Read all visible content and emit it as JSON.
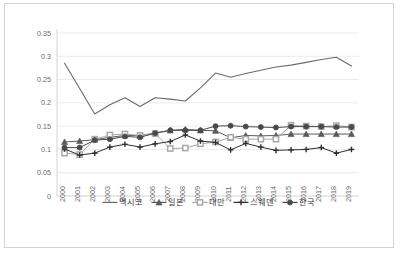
{
  "chart_data": {
    "type": "line",
    "title": "",
    "xlabel": "",
    "ylabel": "",
    "ylim": [
      0,
      0.35
    ],
    "grid": true,
    "legend_position": "bottom",
    "yticks": [
      "0",
      "0.05",
      "0.1",
      "0.15",
      "0.2",
      "0.25",
      "0.3",
      "0.35"
    ],
    "ytick_values": [
      0,
      0.05,
      0.1,
      0.15,
      0.2,
      0.25,
      0.3,
      0.35
    ],
    "categories": [
      "2000",
      "2001",
      "2002",
      "2003",
      "2004",
      "2005",
      "2006",
      "2007",
      "2008",
      "2009",
      "2010",
      "2011",
      "2012",
      "2013",
      "2014",
      "2015",
      "2016",
      "2017",
      "2018",
      "2019"
    ],
    "series": [
      {
        "name": "멕시코",
        "marker": "none",
        "color": "#6b6b6b",
        "values": [
          0.285,
          0.231,
          0.176,
          0.196,
          0.211,
          0.192,
          0.211,
          0.208,
          0.204,
          0.232,
          0.264,
          0.255,
          0.263,
          0.27,
          0.277,
          0.281,
          0.287,
          0.293,
          0.298,
          0.279
        ]
      },
      {
        "name": "일본",
        "marker": "triangle",
        "color": "#5a5a5a",
        "values": [
          0.116,
          0.118,
          0.121,
          0.126,
          0.13,
          0.13,
          0.135,
          0.141,
          0.143,
          0.141,
          0.14,
          0.125,
          0.13,
          0.129,
          0.13,
          0.133,
          0.133,
          0.133,
          0.133,
          0.133
        ]
      },
      {
        "name": "대만",
        "marker": "square",
        "color": "#a8a8a8",
        "values": [
          0.092,
          0.089,
          0.122,
          0.131,
          0.133,
          0.13,
          0.134,
          0.102,
          0.103,
          0.112,
          0.116,
          0.126,
          0.122,
          0.122,
          0.122,
          0.152,
          0.15,
          0.149,
          0.151,
          0.148
        ]
      },
      {
        "name": "스웨덴",
        "marker": "plus",
        "color": "#2f2f2f",
        "values": [
          0.101,
          0.088,
          0.092,
          0.105,
          0.111,
          0.105,
          0.112,
          0.117,
          0.131,
          0.118,
          0.115,
          0.099,
          0.113,
          0.105,
          0.098,
          0.099,
          0.1,
          0.104,
          0.092,
          0.1
        ]
      },
      {
        "name": "한국",
        "marker": "circle",
        "color": "#4a4a4a",
        "values": [
          0.104,
          0.104,
          0.12,
          0.122,
          0.128,
          0.126,
          0.135,
          0.141,
          0.141,
          0.141,
          0.15,
          0.151,
          0.149,
          0.148,
          0.147,
          0.149,
          0.149,
          0.149,
          0.148,
          0.148
        ]
      }
    ]
  }
}
